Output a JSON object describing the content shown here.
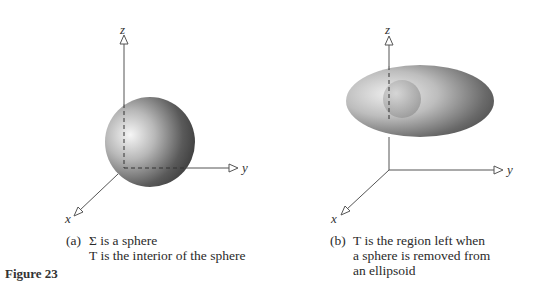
{
  "figure": {
    "label": "Figure 23",
    "panels": [
      {
        "id": "a",
        "tag": "(a)",
        "caption_lines": [
          "Σ is a sphere",
          "T is the interior of the sphere"
        ],
        "axes": {
          "x": "x",
          "y": "y",
          "z": "z"
        },
        "shape": "sphere"
      },
      {
        "id": "b",
        "tag": "(b)",
        "caption_lines": [
          "T is the region left when",
          "a sphere is removed from",
          "an ellipsoid"
        ],
        "axes": {
          "x": "x",
          "y": "y",
          "z": "z"
        },
        "shape": "ellipsoid with spherical cavity"
      }
    ]
  },
  "colors": {
    "axis": "#555555",
    "shade_light": "#f4f4f4",
    "shade_dark": "#3a3a3a"
  }
}
